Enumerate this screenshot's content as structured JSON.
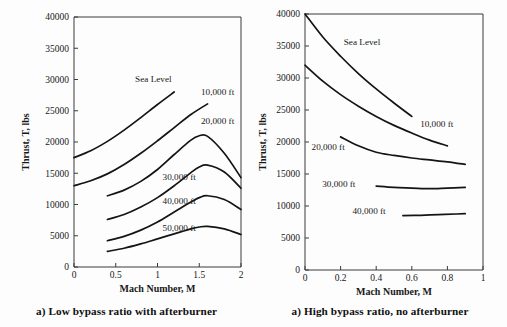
{
  "figure": {
    "panels": [
      {
        "id": "low-bypass",
        "caption": "a) Low bypass ratio with afterburner",
        "xlabel": "Mach Number, M",
        "ylabel": "Thrust, T, lbs"
      },
      {
        "id": "high-bypass",
        "caption": "a) High bypass ratio, no afterburner",
        "xlabel": "Mach Number, M",
        "ylabel": "Thrust, T, lbs"
      }
    ]
  },
  "chart_data": [
    {
      "type": "line",
      "title": "a) Low bypass ratio with afterburner",
      "xlabel": "Mach Number, M",
      "ylabel": "Thrust, T, lbs",
      "xlim": [
        0,
        2
      ],
      "ylim": [
        0,
        40000
      ],
      "xticks": [
        0,
        0.5,
        1,
        1.5,
        2
      ],
      "xtick_labels": [
        "0",
        "0.5",
        "1",
        "1.5",
        "2"
      ],
      "yticks": [
        0,
        5000,
        10000,
        15000,
        20000,
        25000,
        30000,
        35000,
        40000
      ],
      "ytick_labels": [
        "0",
        "5000",
        "10000",
        "15000",
        "20000",
        "25000",
        "30000",
        "35000",
        "40000"
      ],
      "grid": false,
      "legend": "inline-curve-labels",
      "series": [
        {
          "name": "Sea Level",
          "label": "Sea Level",
          "label_position": {
            "x": 0.95,
            "y": 29600
          },
          "x": [
            0.0,
            0.2,
            0.4,
            0.6,
            0.8,
            1.0,
            1.2
          ],
          "y": [
            17500,
            18600,
            20100,
            21900,
            23900,
            26000,
            28000
          ]
        },
        {
          "name": "10,000 ft",
          "label": "10,000 ft",
          "label_position": {
            "x": 1.72,
            "y": 27600
          },
          "x": [
            0.0,
            0.2,
            0.4,
            0.6,
            0.8,
            1.0,
            1.2,
            1.4,
            1.6
          ],
          "y": [
            13000,
            13800,
            14900,
            16400,
            18200,
            20200,
            22300,
            24400,
            26100
          ]
        },
        {
          "name": "20,000 ft",
          "label": "20,000 ft",
          "label_position": {
            "x": 1.72,
            "y": 22900
          },
          "x": [
            0.4,
            0.6,
            0.8,
            1.0,
            1.2,
            1.4,
            1.5,
            1.6,
            1.8,
            2.0
          ],
          "y": [
            11400,
            12300,
            13700,
            15600,
            18000,
            20300,
            21000,
            20900,
            18200,
            14300
          ]
        },
        {
          "name": "30,000 ft",
          "label": "30,000 ft",
          "label_position": {
            "x": 1.26,
            "y": 14000
          },
          "x": [
            0.4,
            0.6,
            0.8,
            1.0,
            1.2,
            1.4,
            1.5,
            1.6,
            1.8,
            2.0
          ],
          "y": [
            7600,
            8400,
            9600,
            11100,
            13000,
            15100,
            16000,
            16300,
            15200,
            12600
          ]
        },
        {
          "name": "40,000 ft",
          "label": "40,000 ft",
          "label_position": {
            "x": 1.26,
            "y": 10100
          },
          "x": [
            0.4,
            0.6,
            0.8,
            1.0,
            1.2,
            1.4,
            1.5,
            1.6,
            1.8,
            2.0
          ],
          "y": [
            4200,
            4900,
            5900,
            7200,
            8800,
            10400,
            11100,
            11400,
            10800,
            9200
          ]
        },
        {
          "name": "50,000 ft",
          "label": "50,000 ft",
          "label_position": {
            "x": 1.26,
            "y": 5700
          },
          "x": [
            0.4,
            0.6,
            0.8,
            1.0,
            1.2,
            1.4,
            1.5,
            1.6,
            1.8,
            2.0
          ],
          "y": [
            2500,
            3000,
            3700,
            4500,
            5300,
            6100,
            6400,
            6500,
            6100,
            5200
          ]
        }
      ]
    },
    {
      "type": "line",
      "title": "a) High bypass ratio, no afterburner",
      "xlabel": "Mach Number, M",
      "ylabel": "Thrust, T, lbs",
      "xlim": [
        0,
        1
      ],
      "ylim": [
        0,
        40000
      ],
      "xticks": [
        0,
        0.2,
        0.4,
        0.6,
        0.8,
        1
      ],
      "xtick_labels": [
        "0",
        "0.2",
        "0.4",
        "0.6",
        "0.8",
        "1"
      ],
      "yticks": [
        0,
        5000,
        10000,
        15000,
        20000,
        25000,
        30000,
        35000,
        40000
      ],
      "ytick_labels": [
        "0",
        "5000",
        "10000",
        "15000",
        "20000",
        "25000",
        "30000",
        "35000",
        "40000"
      ],
      "grid": false,
      "legend": "inline-curve-labels",
      "series": [
        {
          "name": "Sea Level",
          "label": "Sea Level",
          "label_position": {
            "x": 0.32,
            "y": 35100
          },
          "x": [
            0.0,
            0.1,
            0.2,
            0.3,
            0.4,
            0.5,
            0.6
          ],
          "y": [
            40000,
            36400,
            33400,
            30700,
            28300,
            26100,
            24000
          ]
        },
        {
          "name": "10,000 ft",
          "label": "10,000 ft",
          "label_position": {
            "x": 0.74,
            "y": 22400
          },
          "x": [
            0.0,
            0.1,
            0.2,
            0.3,
            0.4,
            0.5,
            0.6,
            0.7,
            0.8
          ],
          "y": [
            32000,
            29500,
            27400,
            25600,
            24000,
            22600,
            21400,
            20300,
            19400
          ]
        },
        {
          "name": "20,000 ft",
          "label": "20,000 ft",
          "label_position": {
            "x": 0.13,
            "y": 18700
          },
          "x": [
            0.2,
            0.3,
            0.4,
            0.5,
            0.6,
            0.7,
            0.8,
            0.9
          ],
          "y": [
            20800,
            19400,
            18400,
            17900,
            17500,
            17200,
            16900,
            16500
          ]
        },
        {
          "name": "30,000 ft",
          "label": "30,000 ft",
          "label_position": {
            "x": 0.19,
            "y": 13000
          },
          "x": [
            0.4,
            0.5,
            0.6,
            0.7,
            0.8,
            0.9
          ],
          "y": [
            13100,
            12900,
            12800,
            12700,
            12800,
            12900
          ]
        },
        {
          "name": "40,000 ft",
          "label": "40,000 ft",
          "label_position": {
            "x": 0.36,
            "y": 8800
          },
          "x": [
            0.55,
            0.65,
            0.75,
            0.85,
            0.9
          ],
          "y": [
            8500,
            8550,
            8650,
            8750,
            8800
          ]
        }
      ]
    }
  ]
}
